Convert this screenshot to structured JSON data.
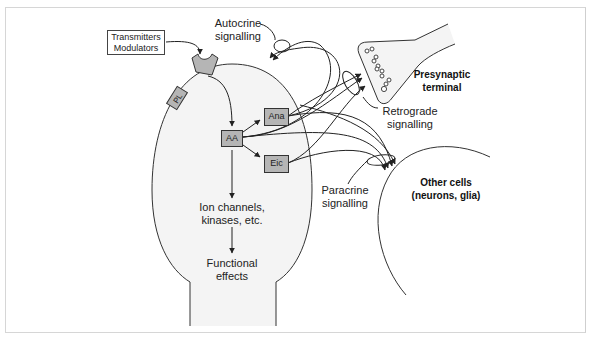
{
  "diagram": {
    "source_box": {
      "line1": "Transmitters",
      "line2": "Modulators"
    },
    "membrane_components": {
      "receptor": "receptor",
      "phospholipid": "PL"
    },
    "nodes": {
      "aa": "AA",
      "ana": "Ana",
      "eic": "Eic"
    },
    "downstream": {
      "ion_channels_line1": "Ion channels,",
      "ion_channels_line2": "kinases, etc.",
      "functional_line1": "Functional",
      "functional_line2": "effects"
    },
    "signalling_labels": {
      "autocrine_line1": "Autocrine",
      "autocrine_line2": "signalling",
      "retrograde_line1": "Retrograde",
      "retrograde_line2": "signalling",
      "paracrine_line1": "Paracrine",
      "paracrine_line2": "signalling"
    },
    "targets": {
      "presynaptic_line1": "Presynaptic",
      "presynaptic_line2": "terminal",
      "other_cells_line1": "Other cells",
      "other_cells_line2": "(neurons, glia)"
    },
    "colors": {
      "cell_fill": "#f4f4f4",
      "node_fill": "#b5b5b5",
      "stroke": "#333333",
      "frame": "#d6d6d6"
    }
  }
}
